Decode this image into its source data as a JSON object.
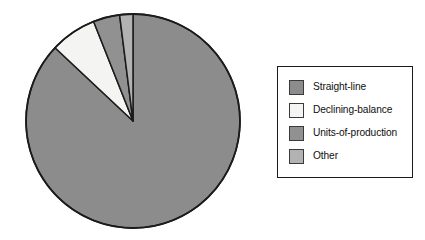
{
  "chart_data": {
    "type": "pie",
    "title": "",
    "categories": [
      "Straight-line",
      "Declining-balance",
      "Units-of-production",
      "Other"
    ],
    "values": [
      87,
      7,
      4,
      2
    ],
    "colors": [
      "#8c8c8c",
      "#f4f4f2",
      "#919191",
      "#b2b2b2"
    ],
    "legend_position": "right",
    "grid": false,
    "start_angle_deg": 90,
    "direction": "clockwise",
    "slice_outline_color": "#1b1b1b",
    "geometry": {
      "center_x": 133,
      "center_y": 121,
      "radius": 107
    }
  },
  "legend": {
    "entries": [
      {
        "label": "Straight-line",
        "color": "#8c8c8c"
      },
      {
        "label": "Declining-balance",
        "color": "#f4f4f2"
      },
      {
        "label": "Units-of-production",
        "color": "#919191"
      },
      {
        "label": "Other",
        "color": "#b2b2b2"
      }
    ]
  }
}
